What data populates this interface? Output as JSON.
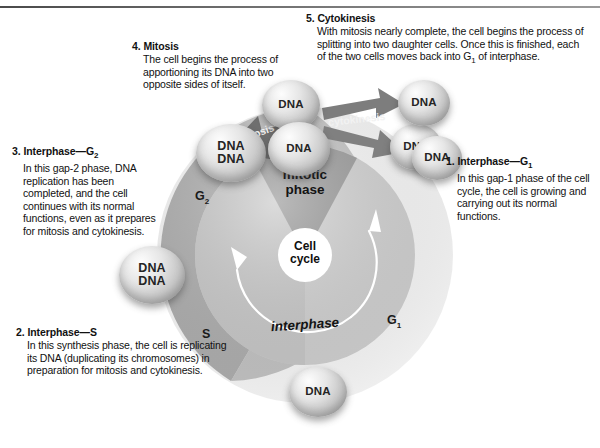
{
  "figure": {
    "title": "The cell cycle",
    "center_label_line1": "Cell",
    "center_label_line2": "cycle"
  },
  "wheel": {
    "phase_words": {
      "mitotic_line1": "mitotic",
      "mitotic_line2": "phase",
      "interphase": "interphase"
    },
    "ring_labels": {
      "g1": "G",
      "g1_sub": "1",
      "g2": "G",
      "g2_sub": "2",
      "s": "S"
    },
    "colors": {
      "ring_g1": "#c9c9c9",
      "ring_s": "#b4b4b4",
      "ring_g2": "#bfbfbf",
      "inner_interphase_right": "#d8d8d8",
      "inner_interphase_left": "#cfcfcf",
      "inner_mitotic": "#9e9e9e",
      "center": "#ffffff",
      "arrow_dark": "#6d6d6d",
      "arrow_mid": "#7a7a7a"
    }
  },
  "arrows": {
    "mitosis": "mitosis",
    "cytokinesis": "cytokinesis"
  },
  "cells": [
    {
      "id": "cell-g1",
      "labels": [
        "DNA"
      ]
    },
    {
      "id": "cell-g2",
      "labels": [
        "DNA",
        "DNA"
      ]
    },
    {
      "id": "cell-s",
      "labels": [
        "DNA"
      ]
    },
    {
      "id": "cell-mitotic",
      "labels": [
        "DNA",
        "DNA"
      ]
    },
    {
      "id": "cell-div-top",
      "labels": [
        "DNA"
      ]
    },
    {
      "id": "cell-div-bot",
      "labels": [
        "DNA"
      ]
    },
    {
      "id": "cell-d1",
      "labels": [
        "DNA"
      ]
    },
    {
      "id": "cell-d2",
      "labels": [
        "DNA"
      ]
    }
  ],
  "callouts": {
    "one": {
      "number": "1.",
      "heading": "Interphase",
      "dash": "—",
      "phase": "G",
      "phase_sub": "1",
      "body": "In this gap-1 phase of the cell cycle, the cell is growing and carrying out its normal functions."
    },
    "two": {
      "number": "2.",
      "heading": "Interphase",
      "dash": "—",
      "phase": "S",
      "body": "In this synthesis phase, the cell is replicating its DNA (duplicating its chromosomes) in preparation for mitosis and cytokinesis."
    },
    "three": {
      "number": "3.",
      "heading": "Interphase",
      "dash": "—",
      "phase": "G",
      "phase_sub": "2",
      "body": "In this gap-2 phase, DNA replication has been completed, and the cell continues with its normal functions, even as it prepares for mitosis and cytokinesis."
    },
    "four": {
      "number": "4.",
      "heading": "Mitosis",
      "body": "The cell begins the process of apportioning its DNA into two opposite sides of itself."
    },
    "five": {
      "number": "5.",
      "heading": "Cytokinesis",
      "body_part1": "With mitosis nearly complete, the cell begins the process of splitting into two daughter cells. Once this is finished, each of the two cells moves back into G",
      "body_sub": "1",
      "body_part2": " of interphase."
    }
  }
}
